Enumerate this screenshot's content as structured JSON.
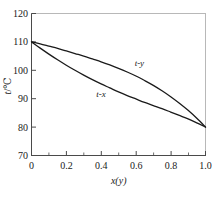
{
  "chart_data": {
    "type": "line",
    "title": "",
    "subtitle": "",
    "xlabel": "x(y)",
    "ylabel": "t/℃",
    "ylabel_symbol": "t",
    "ylabel_unit": "℃",
    "xlim": [
      0,
      1.0
    ],
    "ylim": [
      70,
      120
    ],
    "grid": false,
    "legend": "none",
    "x_ticks": [
      "0",
      "0.2",
      "0.4",
      "0.6",
      "0.8",
      "1.0"
    ],
    "x_tick_values": [
      0,
      0.2,
      0.4,
      0.6,
      0.8,
      1.0
    ],
    "x_minor_tick_values": [
      0.1,
      0.3,
      0.5,
      0.7,
      0.9
    ],
    "y_ticks": [
      "70",
      "80",
      "90",
      "100",
      "110",
      "120"
    ],
    "y_tick_values": [
      70,
      80,
      90,
      100,
      110,
      120
    ],
    "annotations": [
      {
        "text": "t-y",
        "x": 0.62,
        "y": 101.5,
        "name": "dew-point-curve-label"
      },
      {
        "text": "t-x",
        "x": 0.4,
        "y": 90.5,
        "name": "bubble-point-curve-label"
      }
    ],
    "series": [
      {
        "name": "t-y",
        "role": "dew-point-curve",
        "color": "#1a1a1a",
        "x": [
          0.0,
          0.05,
          0.1,
          0.15,
          0.2,
          0.25,
          0.3,
          0.35,
          0.4,
          0.45,
          0.5,
          0.55,
          0.6,
          0.65,
          0.7,
          0.75,
          0.8,
          0.85,
          0.9,
          0.95,
          1.0
        ],
        "values": [
          110.0,
          109.3,
          108.5,
          107.7,
          106.8,
          105.9,
          105.0,
          104.0,
          103.0,
          101.9,
          100.7,
          99.4,
          98.0,
          96.4,
          94.7,
          92.8,
          90.7,
          88.4,
          85.9,
          83.1,
          80.0
        ]
      },
      {
        "name": "t-x",
        "role": "bubble-point-curve",
        "color": "#1a1a1a",
        "x": [
          0.0,
          0.05,
          0.1,
          0.15,
          0.2,
          0.25,
          0.3,
          0.35,
          0.4,
          0.45,
          0.5,
          0.55,
          0.6,
          0.65,
          0.7,
          0.75,
          0.8,
          0.85,
          0.9,
          0.95,
          1.0
        ],
        "values": [
          110.0,
          107.8,
          105.7,
          103.7,
          101.8,
          100.0,
          98.3,
          96.7,
          95.2,
          93.8,
          92.4,
          91.1,
          89.9,
          88.7,
          87.6,
          86.5,
          85.3,
          84.1,
          82.9,
          81.5,
          80.0
        ]
      }
    ],
    "endpoints": {
      "left_common_temperature": 110,
      "right_common_temperature": 80
    }
  }
}
